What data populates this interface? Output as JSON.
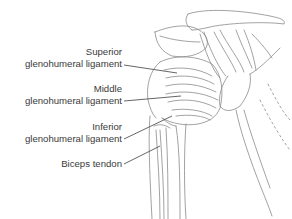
{
  "diagram": {
    "colors": {
      "ink": "#3a3a3a",
      "line": "#555555",
      "sketch": "#8a8a8a",
      "background": "#ffffff"
    },
    "labels": [
      {
        "id": "superior",
        "line1": "Superior",
        "line2": "glenohumeral ligament"
      },
      {
        "id": "middle",
        "line1": "Middle",
        "line2": "glenohumeral ligament"
      },
      {
        "id": "inferior",
        "line1": "Inferior",
        "line2": "glenohumeral ligament"
      },
      {
        "id": "biceps",
        "line1": "Biceps tendon"
      }
    ]
  }
}
